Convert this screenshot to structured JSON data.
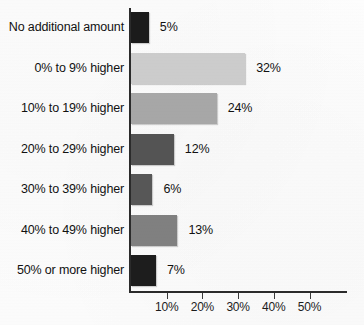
{
  "chart_data": {
    "type": "bar",
    "orientation": "horizontal",
    "title": "",
    "subtitle": "",
    "xlabel": "",
    "ylabel": "",
    "categories": [
      "No additional amount",
      "0% to 9% higher",
      "10% to 19% higher",
      "20% to 29% higher",
      "30% to 39% higher",
      "40% to 49% higher",
      "50% or more higher"
    ],
    "values": [
      5,
      32,
      24,
      12,
      6,
      13,
      7
    ],
    "value_labels": [
      "5%",
      "32%",
      "24%",
      "12%",
      "6%",
      "13%",
      "7%"
    ],
    "bar_colors": [
      "#1b1b1b",
      "#cccccc",
      "#a7a7a7",
      "#545454",
      "#575757",
      "#808080",
      "#1d1d1d"
    ],
    "xlim": [
      0,
      59
    ],
    "xticks": [
      10,
      20,
      30,
      40,
      50
    ],
    "xtick_labels": [
      "10%",
      "20%",
      "30%",
      "40%",
      "50%"
    ],
    "grid": false,
    "legend": null,
    "axis_color": "#2b2b2b"
  }
}
